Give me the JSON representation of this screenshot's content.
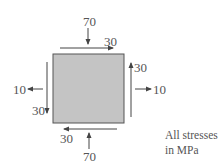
{
  "diagram": {
    "type": "stress-element",
    "element_fill": "#c4c4c4",
    "labels": {
      "top_normal": "70",
      "top_shear": "30",
      "bottom_normal": "70",
      "bottom_shear": "30",
      "left_normal": "10",
      "left_shear": "30",
      "right_normal": "10",
      "right_shear": "30"
    },
    "note": {
      "line1": "All stresses",
      "line2": "in MPa"
    }
  }
}
